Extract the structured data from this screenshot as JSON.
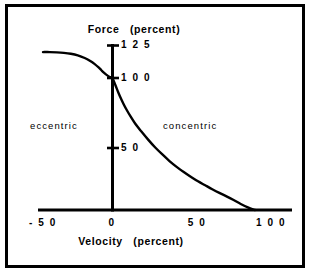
{
  "chart_data": {
    "type": "line",
    "title": "",
    "xlabel": "Velocity   (percent)",
    "ylabel": "Force   (percent)",
    "xlim": [
      -62,
      112
    ],
    "ylim": [
      -8,
      133
    ],
    "grid": false,
    "legend": null,
    "x_ticks": [
      {
        "value": -50,
        "label": "- 5 0"
      },
      {
        "value": 0,
        "label": "0"
      },
      {
        "value": 50,
        "label": "5 0"
      },
      {
        "value": 100,
        "label": "1 0 0"
      }
    ],
    "y_ticks": [
      {
        "value": 50,
        "label": "5 0"
      },
      {
        "value": 100,
        "label": "1 0 0"
      },
      {
        "value": 125,
        "label": "1 2 5"
      }
    ],
    "annotations": [
      {
        "text": "eccentric",
        "x": -33,
        "y": 68
      },
      {
        "text": "concentric",
        "x": 42,
        "y": 68
      }
    ],
    "series": [
      {
        "name": "force-velocity",
        "x": [
          -50,
          -45,
          -40,
          -35,
          -30,
          -25,
          -20,
          -16,
          -13,
          -10,
          -8,
          -6,
          -4,
          -2,
          0,
          2,
          4,
          6,
          8,
          10,
          13,
          16,
          20,
          25,
          30,
          35,
          40,
          45,
          50,
          55,
          60,
          65,
          70,
          75,
          80,
          85,
          90,
          95,
          100
        ],
        "y": [
          120,
          120,
          119.8,
          119.4,
          118.7,
          117.5,
          115.5,
          113.2,
          111,
          108.3,
          106.2,
          104.2,
          102.5,
          101.1,
          100,
          95,
          89.5,
          84.5,
          80,
          76,
          70.5,
          65.5,
          60,
          53.5,
          47.5,
          42.2,
          37.2,
          32.8,
          28.8,
          25.2,
          21.8,
          18.8,
          15.8,
          13,
          10.4,
          7.6,
          4.6,
          2.0,
          0
        ]
      }
    ]
  },
  "axis_labels": {
    "y_title": "Force",
    "y_title_unit": "(percent)",
    "x_title": "Velocity",
    "x_title_unit": "(percent)"
  },
  "ticks": {
    "y125": "1 2 5",
    "y100": "1 0 0",
    "y50": "5 0",
    "xneg50": "- 5 0",
    "x0": "0",
    "x50": "5 0",
    "x100": "1 0 0"
  },
  "regions": {
    "left": "eccentric",
    "right": "concentric"
  },
  "colors": {
    "ink": "#000000",
    "paper": "#ffffff"
  }
}
